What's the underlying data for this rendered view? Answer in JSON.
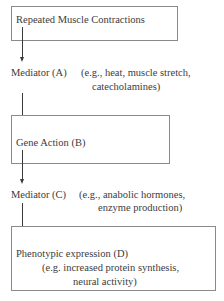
{
  "diagram": {
    "type": "flowchart",
    "direction": "top-to-bottom",
    "nodes": [
      {
        "id": "contractions",
        "label": "Repeated Muscle Contractions",
        "boxed": true
      },
      {
        "id": "A",
        "label": "Mediator (A)",
        "detail_line1": "(e.g., heat, muscle stretch,",
        "detail_line2": "catecholamines)",
        "boxed": false
      },
      {
        "id": "B",
        "label": "Gene Action (B)",
        "boxed": true
      },
      {
        "id": "C",
        "label": "Mediator (C)",
        "detail_line1": "(e.g., anabolic hormones,",
        "detail_line2": "enzyme production)",
        "boxed": false
      },
      {
        "id": "D",
        "label": "Phenotypic expression (D)",
        "detail_line1": "(e.g. increased protein synthesis,",
        "detail_line2": "neural activity)",
        "boxed": true
      }
    ],
    "edges": [
      {
        "from": "contractions",
        "to": "A"
      },
      {
        "from": "A",
        "to": "B"
      },
      {
        "from": "B",
        "to": "C"
      },
      {
        "from": "C",
        "to": "D"
      }
    ],
    "colors": {
      "box_border": "#8a8a8a",
      "arrow": "#3a3a3a",
      "text": "#3c3c3c"
    }
  }
}
